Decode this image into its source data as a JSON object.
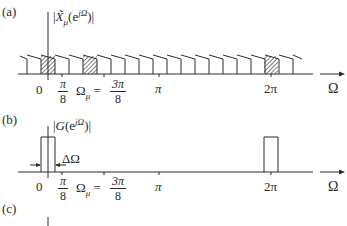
{
  "figure": {
    "panels": [
      {
        "tag": "(a)",
        "ylabel_open": "|",
        "ylabel_sym": "X̃",
        "ylabel_sub": "μ",
        "ylabel_arg": "(e",
        "ylabel_sup": "jΩ",
        "ylabel_close": ")|",
        "description": "Periodic sawtooth spectrum with hatched band at Omega_mu and its 2pi replica"
      },
      {
        "tag": "(b)",
        "ylabel_open": "|",
        "ylabel_sym": "G",
        "ylabel_arg": "(e",
        "ylabel_sup": "jΩ",
        "ylabel_close": ")|",
        "delta_label": "ΔΩ",
        "description": "Rectangular lowpass filter of width Delta Omega at 0 and 2pi"
      },
      {
        "tag": "(c)"
      }
    ],
    "ticks": {
      "zero": "0",
      "pi_over_8_num": "π",
      "pi_over_8_den": "8",
      "omega_mu": "Ω",
      "omega_mu_sub": "μ",
      "equals": " = ",
      "three_pi_over_8_num": "3π",
      "three_pi_over_8_den": "8",
      "pi": "π",
      "two_pi": "2π"
    },
    "axis_label": "Ω",
    "colors": {
      "ink": "#2a2a2a",
      "background": "#ffffff"
    }
  }
}
